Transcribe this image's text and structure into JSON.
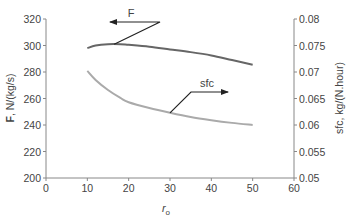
{
  "chart_data": {
    "type": "line",
    "title": "",
    "xlabel": "r_o",
    "xlabel_main": "r",
    "xlabel_sub": "o",
    "ylabel_left_bold": "F",
    "ylabel_left_rest": ", N/(kg/s)",
    "ylabel_right": "sfc, kg/(N.hour)",
    "xlim": [
      0,
      60
    ],
    "ylim_left": [
      200,
      320
    ],
    "ylim_right": [
      0.05,
      0.08
    ],
    "x_ticks": [
      "0",
      "10",
      "20",
      "30",
      "40",
      "50",
      "60"
    ],
    "y_left_ticks": [
      "200",
      "220",
      "240",
      "260",
      "280",
      "300",
      "320"
    ],
    "y_right_ticks": [
      "0.05",
      "0.055",
      "0.06",
      "0.065",
      "0.07",
      "0.075",
      "0.08"
    ],
    "grid": false,
    "series": [
      {
        "name": "F",
        "axis": "left",
        "color": "#666666",
        "x": [
          10,
          12,
          15,
          18,
          20,
          25,
          30,
          35,
          40,
          45,
          50
        ],
        "values": [
          298,
          300,
          301,
          301,
          300.5,
          299,
          297,
          295,
          292.5,
          289,
          285.5
        ]
      },
      {
        "name": "sfc",
        "axis": "right",
        "color": "#aaaaaa",
        "x": [
          10,
          12,
          15,
          18,
          20,
          25,
          30,
          35,
          40,
          45,
          50
        ],
        "values": [
          0.0702,
          0.0685,
          0.0666,
          0.0651,
          0.0643,
          0.0632,
          0.0623,
          0.0615,
          0.0609,
          0.0604,
          0.06
        ]
      }
    ],
    "annotations": [
      {
        "label": "F",
        "arrow": "left",
        "target_series": "F"
      },
      {
        "label": "sfc",
        "arrow": "right",
        "target_series": "sfc"
      }
    ]
  }
}
